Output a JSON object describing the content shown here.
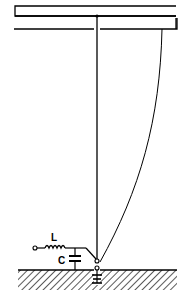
{
  "diagram": {
    "type": "antenna-schematic",
    "labels": {
      "inductor": "L",
      "capacitor": "C"
    },
    "elements": [
      {
        "name": "top-support-beam",
        "kind": "rectangle"
      },
      {
        "name": "vertical-radiator-wire",
        "kind": "line"
      },
      {
        "name": "curved-guy-wire",
        "kind": "curve"
      },
      {
        "name": "loading-coil",
        "kind": "inductor",
        "label": "L"
      },
      {
        "name": "loading-capacitor",
        "kind": "capacitor",
        "label": "C"
      },
      {
        "name": "feed-terminal",
        "kind": "terminal"
      },
      {
        "name": "base-insulator",
        "kind": "insulator"
      },
      {
        "name": "ground-plane",
        "kind": "hatched-ground"
      }
    ],
    "colors": {
      "line": "#000000",
      "background": "#ffffff"
    }
  }
}
